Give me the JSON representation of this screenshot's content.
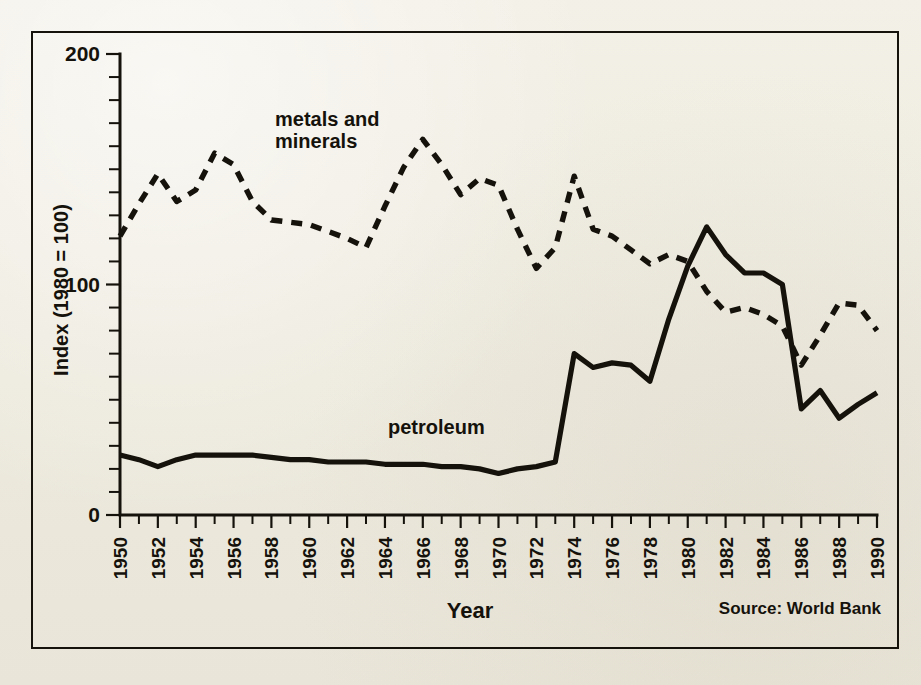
{
  "figure": {
    "background_color": "#efece2",
    "ink_color": "#15120c",
    "source_note": "Source: World Bank"
  },
  "annotations": {
    "metals_label_line1": "metals and",
    "metals_label_line2": "minerals",
    "petroleum_label": "petroleum"
  },
  "chart_data": {
    "type": "line",
    "title": "",
    "subtitle": "",
    "xlabel": "Year",
    "ylabel": "Index (1980 = 100)",
    "xlim": [
      1950,
      1990
    ],
    "ylim": [
      0,
      200
    ],
    "ytick_labels": [
      "0",
      "100",
      "200"
    ],
    "ytick_values": [
      0,
      100,
      200
    ],
    "yminor_step": 10,
    "xtick_labels": [
      "1950",
      "1952",
      "1954",
      "1956",
      "1958",
      "1960",
      "1962",
      "1964",
      "1966",
      "1968",
      "1970",
      "1972",
      "1974",
      "1976",
      "1978",
      "1980",
      "1982",
      "1984",
      "1986",
      "1988",
      "1990"
    ],
    "xtick_values": [
      1950,
      1952,
      1954,
      1956,
      1958,
      1960,
      1962,
      1964,
      1966,
      1968,
      1970,
      1972,
      1974,
      1976,
      1978,
      1980,
      1982,
      1984,
      1986,
      1988,
      1990
    ],
    "xminor_step": 1,
    "grid": false,
    "legend_position": "inline-annotation",
    "x": [
      1950,
      1951,
      1952,
      1953,
      1954,
      1955,
      1956,
      1957,
      1958,
      1959,
      1960,
      1961,
      1962,
      1963,
      1964,
      1965,
      1966,
      1967,
      1968,
      1969,
      1970,
      1971,
      1972,
      1973,
      1974,
      1975,
      1976,
      1977,
      1978,
      1979,
      1980,
      1981,
      1982,
      1983,
      1984,
      1985,
      1986,
      1987,
      1988,
      1989,
      1990
    ],
    "series": [
      {
        "name": "metals and minerals",
        "style": "dashed",
        "values": [
          121,
          135,
          148,
          136,
          141,
          157,
          152,
          136,
          128,
          127,
          126,
          123,
          120,
          116,
          134,
          151,
          163,
          152,
          139,
          146,
          143,
          124,
          107,
          116,
          147,
          124,
          121,
          115,
          109,
          113,
          110,
          97,
          88,
          90,
          87,
          82,
          65,
          78,
          92,
          91,
          80
        ]
      },
      {
        "name": "petroleum",
        "style": "solid",
        "values": [
          26,
          24,
          21,
          24,
          26,
          26,
          26,
          26,
          25,
          24,
          24,
          23,
          23,
          23,
          22,
          22,
          22,
          21,
          21,
          20,
          18,
          20,
          21,
          23,
          70,
          64,
          66,
          65,
          58,
          85,
          108,
          125,
          113,
          105,
          105,
          100,
          46,
          54,
          42,
          48,
          53
        ]
      }
    ]
  }
}
